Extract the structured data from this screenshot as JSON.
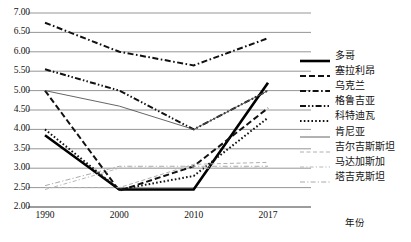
{
  "chart_data": {
    "type": "line",
    "title": "",
    "xlabel": "年份",
    "ylabel": "",
    "x": [
      1990,
      2000,
      2010,
      2017
    ],
    "xtick_labels": [
      "1990",
      "2000",
      "2010",
      "2017"
    ],
    "ylim": [
      2.0,
      7.0
    ],
    "ytick_labels": [
      "7.00",
      "6.50",
      "6.00",
      "5.50",
      "5.00",
      "4.50",
      "4.00",
      "3.50",
      "3.00",
      "2.50",
      "2.00"
    ],
    "ytick_values": [
      7.0,
      6.5,
      6.0,
      5.5,
      5.0,
      4.5,
      4.0,
      3.5,
      3.0,
      2.5,
      2.0
    ],
    "grid": true,
    "legend_position": "right",
    "series": [
      {
        "name": "多哥",
        "style": "solid-thick",
        "color": "#000000",
        "values": [
          3.85,
          2.45,
          2.45,
          5.2
        ]
      },
      {
        "name": "塞拉利昂",
        "style": "dashed",
        "color": "#111111",
        "values": [
          5.0,
          2.42,
          3.05,
          4.55
        ]
      },
      {
        "name": "乌克兰",
        "style": "dash-dot",
        "color": "#111111",
        "values": [
          6.75,
          6.0,
          5.65,
          6.35
        ]
      },
      {
        "name": "格鲁吉亚",
        "style": "dash-dot-dot",
        "color": "#111111",
        "values": [
          5.55,
          5.0,
          4.0,
          5.0
        ]
      },
      {
        "name": "科特迪瓦",
        "style": "dotted",
        "color": "#111111",
        "values": [
          4.0,
          2.45,
          2.8,
          4.3
        ]
      },
      {
        "name": "肯尼亚",
        "style": "solid-thin",
        "color": "#555555",
        "values": [
          5.0,
          4.6,
          4.0,
          5.0
        ]
      },
      {
        "name": "吉尔吉斯斯坦",
        "style": "dashed-light",
        "color": "#b0b0b0",
        "values": [
          2.5,
          2.5,
          3.1,
          3.15
        ]
      },
      {
        "name": "马达加斯加",
        "style": "dash-dot-light",
        "color": "#b8b8b8",
        "values": [
          2.45,
          3.0,
          3.0,
          3.0
        ]
      },
      {
        "name": "塔吉克斯坦",
        "style": "dash-dot-light2",
        "color": "#aaaaaa",
        "values": [
          2.55,
          3.05,
          3.05,
          3.05
        ]
      }
    ]
  }
}
